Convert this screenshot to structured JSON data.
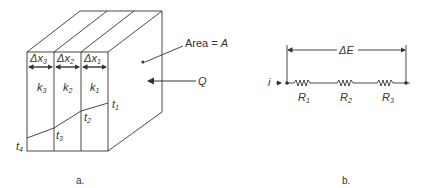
{
  "figure_a": {
    "caption": "a.",
    "area_label": "Area = ",
    "area_symbol": "A",
    "heat_flow_label": "Q",
    "layers": [
      {
        "thickness": "Δx",
        "thickness_sub": "3",
        "k": "k",
        "k_sub": "3"
      },
      {
        "thickness": "Δx",
        "thickness_sub": "2",
        "k": "k",
        "k_sub": "2"
      },
      {
        "thickness": "Δx",
        "thickness_sub": "1",
        "k": "k",
        "k_sub": "1"
      }
    ],
    "temperatures": [
      {
        "t": "t",
        "sub": "1"
      },
      {
        "t": "t",
        "sub": "2"
      },
      {
        "t": "t",
        "sub": "3"
      },
      {
        "t": "t",
        "sub": "4"
      }
    ]
  },
  "figure_b": {
    "caption": "b.",
    "potential_label": "ΔE",
    "current_label": "i",
    "resistors": [
      {
        "r": "R",
        "sub": "1"
      },
      {
        "r": "R",
        "sub": "2"
      },
      {
        "r": "R",
        "sub": "3"
      }
    ]
  }
}
